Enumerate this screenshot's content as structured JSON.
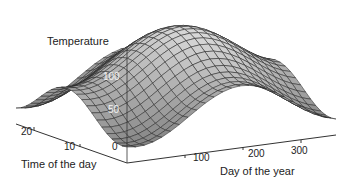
{
  "chart_data": {
    "type": "surface",
    "title": "",
    "zlabel": "Temperature",
    "xlabel": "Day of the year",
    "ylabel": "Time of the day",
    "x_ticks": [
      100,
      200,
      300
    ],
    "y_ticks": [
      0,
      10,
      20
    ],
    "z_ticks": [
      0,
      50,
      100
    ],
    "x_range": [
      0,
      365
    ],
    "y_range": [
      0,
      24
    ],
    "z_range": [
      0,
      130
    ],
    "grid": false,
    "legend": "none",
    "colormap": "gray",
    "surface_model": {
      "base": 10,
      "seasonal_amplitude": 55,
      "seasonal_peak_day": 200,
      "daily_amplitude": 45,
      "daily_peak_hour": 13
    }
  },
  "labels": {
    "zlabel": "Temperature",
    "xlabel": "Day of the year",
    "ylabel": "Time of the day",
    "x_tick_100": "100",
    "x_tick_200": "200",
    "x_tick_300": "300",
    "y_tick_0": "0",
    "y_tick_10": "10",
    "y_tick_20": "20",
    "z_tick_0": "0",
    "z_tick_50": "50",
    "z_tick_100": "100"
  }
}
